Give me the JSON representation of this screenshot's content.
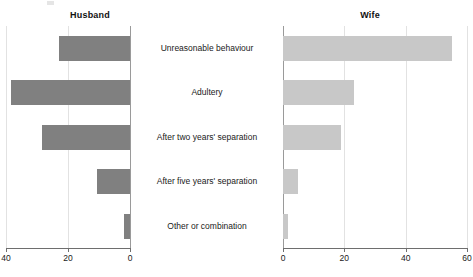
{
  "chart_data": {
    "type": "bar",
    "title": "",
    "subtitle": "",
    "orientation": "horizontal",
    "layout": "back-to-back diverging bar chart (butterfly / tornado)",
    "categories": [
      "Unreasonable behaviour",
      "Adultery",
      "After two years' separation",
      "After five years' separation",
      "Other or combination"
    ],
    "series": [
      {
        "name": "Husband",
        "color": "#808080",
        "direction": "left",
        "axis_reversed": true,
        "xlim": [
          0,
          40
        ],
        "ticks": [
          40,
          20,
          0
        ],
        "values": [
          23,
          38.5,
          28.5,
          10.5,
          2
        ]
      },
      {
        "name": "Wife",
        "color": "#c8c8c8",
        "direction": "right",
        "axis_reversed": false,
        "xlim": [
          0,
          60
        ],
        "ticks": [
          0,
          20,
          40,
          60
        ],
        "values": [
          55,
          23,
          19,
          5,
          1.5
        ]
      }
    ],
    "xlabel": "",
    "ylabel": "",
    "grid": true,
    "legend": "panel titles above each side"
  },
  "panels": {
    "husband": {
      "title": "Husband",
      "ticks": [
        "40",
        "20",
        "0"
      ],
      "tick_values": [
        40,
        20,
        0
      ]
    },
    "wife": {
      "title": "Wife",
      "ticks": [
        "0",
        "20",
        "40",
        "60"
      ],
      "tick_values": [
        0,
        20,
        40,
        60
      ]
    }
  },
  "colors": {
    "husband_bar": "#808080",
    "wife_bar": "#c8c8c8",
    "gridline": "#e2e2e2",
    "axis": "#6e6e6e",
    "text": "#1a1a1a",
    "background": "#ffffff"
  }
}
